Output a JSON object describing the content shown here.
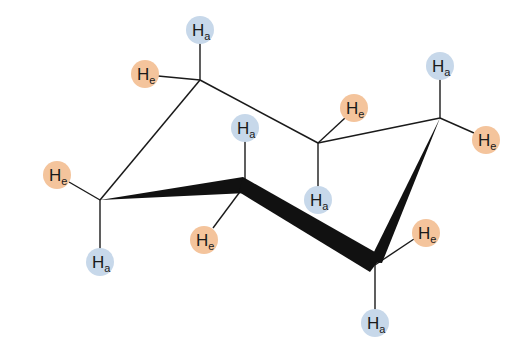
{
  "diagram": {
    "colors": {
      "axial": "#c7d8ea",
      "equatorial": "#f4c49c",
      "bond": "#1a1a1a"
    },
    "carbons": [
      {
        "id": "C1",
        "x": 200,
        "y": 80
      },
      {
        "id": "C2",
        "x": 318,
        "y": 143
      },
      {
        "id": "C3",
        "x": 440,
        "y": 118
      },
      {
        "id": "C4",
        "x": 375,
        "y": 265
      },
      {
        "id": "C5",
        "x": 245,
        "y": 185
      },
      {
        "id": "C6",
        "x": 100,
        "y": 200
      }
    ],
    "hydrogens": [
      {
        "label": "H",
        "sub": "a",
        "type": "axial",
        "carbon": "C1",
        "x": 200,
        "y": 30
      },
      {
        "label": "H",
        "sub": "e",
        "type": "equatorial",
        "carbon": "C1",
        "x": 145,
        "y": 74
      },
      {
        "label": "H",
        "sub": "a",
        "type": "axial",
        "carbon": "C2",
        "x": 318,
        "y": 200
      },
      {
        "label": "H",
        "sub": "e",
        "type": "equatorial",
        "carbon": "C2",
        "x": 354,
        "y": 108
      },
      {
        "label": "H",
        "sub": "a",
        "type": "axial",
        "carbon": "C3",
        "x": 440,
        "y": 66
      },
      {
        "label": "H",
        "sub": "e",
        "type": "equatorial",
        "carbon": "C3",
        "x": 486,
        "y": 140
      },
      {
        "label": "H",
        "sub": "a",
        "type": "axial",
        "carbon": "C4",
        "x": 375,
        "y": 323
      },
      {
        "label": "H",
        "sub": "e",
        "type": "equatorial",
        "carbon": "C4",
        "x": 426,
        "y": 233
      },
      {
        "label": "H",
        "sub": "a",
        "type": "axial",
        "carbon": "C5",
        "x": 245,
        "y": 128
      },
      {
        "label": "H",
        "sub": "e",
        "type": "equatorial",
        "carbon": "C5",
        "x": 204,
        "y": 240
      },
      {
        "label": "H",
        "sub": "a",
        "type": "axial",
        "carbon": "C6",
        "x": 100,
        "y": 262
      },
      {
        "label": "H",
        "sub": "e",
        "type": "equatorial",
        "carbon": "C6",
        "x": 57,
        "y": 175
      }
    ]
  }
}
